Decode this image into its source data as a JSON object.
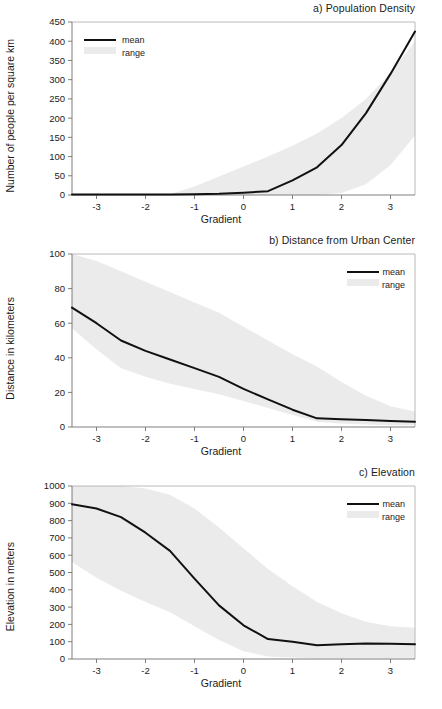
{
  "figure": {
    "panel_count": 3,
    "shared_xlabel": "Gradient",
    "legend_labels": {
      "mean": "mean",
      "range": "range"
    },
    "colors": {
      "mean_line": "#111111",
      "range_band": "#ebebeb",
      "axis": "#6f6f6f",
      "frame": "#a8a8a8",
      "text": "#1b1b1b",
      "background": "#ffffff"
    }
  },
  "chart_data": [
    {
      "type": "line",
      "id": "a",
      "title": "a) Population Density",
      "xlabel": "Gradient",
      "ylabel": "Number of people per square km",
      "xlim": [
        -3.5,
        3.5
      ],
      "ylim": [
        0,
        450
      ],
      "xticks": [
        -3,
        -2,
        -1,
        0,
        1,
        2,
        3
      ],
      "xticklabels": [
        "-3",
        "-2",
        "-1",
        "0",
        "1",
        "2",
        "3"
      ],
      "yticks": [
        0,
        50,
        100,
        150,
        200,
        250,
        300,
        350,
        400,
        450
      ],
      "yticklabels": [
        "0",
        "50",
        "100",
        "150",
        "200",
        "250",
        "300",
        "350",
        "400",
        "450"
      ],
      "grid": false,
      "legend_position": "upper-left",
      "x": [
        -3.5,
        -3.0,
        -2.5,
        -2.0,
        -1.5,
        -1.0,
        -0.5,
        0.0,
        0.5,
        1.0,
        1.5,
        2.0,
        2.5,
        3.0,
        3.5
      ],
      "series": [
        {
          "name": "mean",
          "values": [
            1,
            1,
            1,
            1,
            1,
            2,
            3,
            6,
            10,
            38,
            72,
            130,
            213,
            315,
            425
          ]
        },
        {
          "name": "range",
          "kind": "band",
          "lower": [
            0,
            0,
            0,
            0,
            0,
            0,
            0,
            0,
            0,
            0,
            0,
            5,
            28,
            78,
            155
          ],
          "upper": [
            0,
            0,
            0,
            0,
            2,
            22,
            48,
            74,
            100,
            128,
            160,
            200,
            250,
            318,
            400
          ]
        }
      ]
    },
    {
      "type": "line",
      "id": "b",
      "title": "b) Distance from Urban Center",
      "xlabel": "Gradient",
      "ylabel": "Distance in kilometers",
      "xlim": [
        -3.5,
        3.5
      ],
      "ylim": [
        0,
        100
      ],
      "xticks": [
        -3,
        -2,
        -1,
        0,
        1,
        2,
        3
      ],
      "xticklabels": [
        "-3",
        "-2",
        "-1",
        "0",
        "1",
        "2",
        "3"
      ],
      "yticks": [
        0,
        20,
        40,
        60,
        80,
        100
      ],
      "yticklabels": [
        "0",
        "20",
        "40",
        "60",
        "80",
        "100"
      ],
      "grid": false,
      "legend_position": "upper-right",
      "x": [
        -3.5,
        -3.0,
        -2.5,
        -2.0,
        -1.5,
        -1.0,
        -0.5,
        0.0,
        0.5,
        1.0,
        1.5,
        2.0,
        2.5,
        3.0,
        3.5
      ],
      "series": [
        {
          "name": "mean",
          "values": [
            69,
            60,
            50,
            44,
            39,
            34,
            29,
            22,
            16,
            10,
            5,
            4.5,
            4,
            3.5,
            3
          ]
        },
        {
          "name": "range",
          "kind": "band",
          "lower": [
            57,
            45,
            34,
            29,
            25,
            22,
            19,
            15,
            11,
            7,
            3,
            2,
            1.5,
            1,
            1
          ],
          "upper": [
            100,
            96,
            90,
            84,
            78,
            72,
            66,
            58,
            50,
            42,
            35,
            26,
            18,
            12,
            9
          ]
        }
      ]
    },
    {
      "type": "line",
      "id": "c",
      "title": "c) Elevation",
      "xlabel": "Gradient",
      "ylabel": "Elevation in meters",
      "xlim": [
        -3.5,
        3.5
      ],
      "ylim": [
        0,
        1000
      ],
      "xticks": [
        -3,
        -2,
        -1,
        0,
        1,
        2,
        3
      ],
      "xticklabels": [
        "-3",
        "-2",
        "-1",
        "0",
        "1",
        "2",
        "3"
      ],
      "yticks": [
        0,
        100,
        200,
        300,
        400,
        500,
        600,
        700,
        800,
        900,
        1000
      ],
      "yticklabels": [
        "0",
        "100",
        "200",
        "300",
        "400",
        "500",
        "600",
        "700",
        "800",
        "900",
        "1000"
      ],
      "grid": false,
      "legend_position": "upper-right",
      "x": [
        -3.5,
        -3.0,
        -2.5,
        -2.0,
        -1.5,
        -1.0,
        -0.5,
        0.0,
        0.5,
        1.0,
        1.5,
        2.0,
        2.5,
        3.0,
        3.5
      ],
      "series": [
        {
          "name": "mean",
          "values": [
            895,
            870,
            820,
            730,
            625,
            465,
            310,
            195,
            115,
            100,
            80,
            85,
            90,
            88,
            85
          ]
        },
        {
          "name": "range",
          "kind": "band",
          "lower": [
            560,
            470,
            395,
            330,
            270,
            190,
            110,
            45,
            15,
            8,
            5,
            5,
            5,
            5,
            5
          ],
          "upper": [
            1000,
            1000,
            1000,
            985,
            950,
            870,
            760,
            640,
            520,
            420,
            330,
            265,
            215,
            190,
            180
          ]
        }
      ]
    }
  ]
}
